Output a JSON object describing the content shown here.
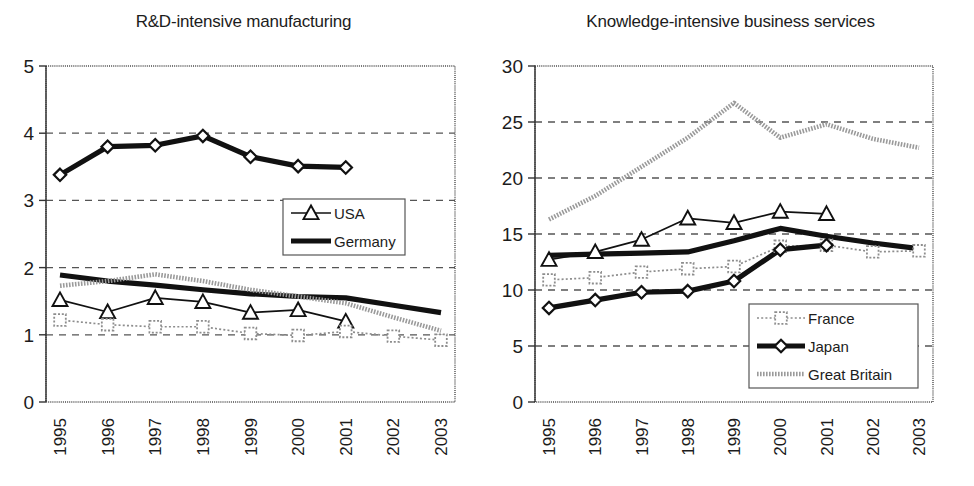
{
  "figure": {
    "width": 974,
    "height": 486,
    "background": "#ffffff"
  },
  "colors": {
    "axis": "#333333",
    "frame": "#4a4a4a",
    "grid": "#555555",
    "germany": "#111111",
    "usa": "#111111",
    "france": "#8d8d8d",
    "great_britain": "#9a9a9a",
    "japan": "#111111"
  },
  "chart_data": [
    {
      "type": "line",
      "panel": "left",
      "title": "R&D-intensive manufacturing",
      "xlabel": "",
      "ylabel": "",
      "x": [
        "1995",
        "1996",
        "1997",
        "1998",
        "1999",
        "2000",
        "2001",
        "2002",
        "2003"
      ],
      "xtick_labels": [
        "1995",
        "1996",
        "1997",
        "1998",
        "1999",
        "2000",
        "2001",
        "2002",
        "2003"
      ],
      "ytick_labels": [
        "0",
        "1",
        "2",
        "3",
        "4",
        "5"
      ],
      "yticks": [
        0,
        1,
        2,
        3,
        4,
        5
      ],
      "ylim": [
        0,
        5
      ],
      "grid": "horizontal-dashed",
      "legend_position": "center-right",
      "legend_entries": [
        "USA",
        "Germany"
      ],
      "series": [
        {
          "name": "Germany",
          "style": "thick-solid-diamond",
          "marker": "diamond",
          "x": [
            "1995",
            "1996",
            "1997",
            "1998",
            "1999",
            "2000",
            "2001"
          ],
          "values": [
            3.38,
            3.8,
            3.82,
            3.96,
            3.65,
            3.51,
            3.49
          ]
        },
        {
          "name": "Germany-low",
          "style": "thick-solid",
          "marker": "none",
          "x": [
            "1995",
            "1996",
            "1997",
            "1998",
            "1999",
            "2000",
            "2001",
            "2002",
            "2003"
          ],
          "values": [
            1.89,
            1.8,
            1.74,
            1.67,
            1.61,
            1.57,
            1.55,
            1.44,
            1.33
          ]
        },
        {
          "name": "Great Britain",
          "style": "hatched-thick",
          "marker": "none",
          "x": [
            "1995",
            "1996",
            "1997",
            "1998",
            "1999",
            "2000",
            "2001",
            "2002",
            "2003"
          ],
          "values": [
            1.73,
            1.8,
            1.9,
            1.8,
            1.67,
            1.57,
            1.47,
            1.26,
            1.06
          ]
        },
        {
          "name": "USA",
          "style": "thin-solid-triangle",
          "marker": "triangle",
          "x": [
            "1995",
            "1996",
            "1997",
            "1998",
            "1999",
            "2000",
            "2001"
          ],
          "values": [
            1.52,
            1.34,
            1.55,
            1.49,
            1.33,
            1.37,
            1.2
          ]
        },
        {
          "name": "France",
          "style": "dotted-square",
          "marker": "square",
          "x": [
            "1995",
            "1996",
            "1997",
            "1998",
            "1999",
            "2000",
            "2001",
            "2002",
            "2003"
          ],
          "values": [
            1.22,
            1.15,
            1.12,
            1.12,
            1.02,
            0.99,
            1.05,
            0.98,
            0.92
          ]
        }
      ]
    },
    {
      "type": "line",
      "panel": "right",
      "title": "Knowledge-intensive business services",
      "xlabel": "",
      "ylabel": "",
      "x": [
        "1995",
        "1996",
        "1997",
        "1998",
        "1999",
        "2000",
        "2001",
        "2002",
        "2003"
      ],
      "xtick_labels": [
        "1995",
        "1996",
        "1997",
        "1998",
        "1999",
        "2000",
        "2001",
        "2002",
        "2003"
      ],
      "ytick_labels": [
        "0",
        "5",
        "10",
        "15",
        "20",
        "25",
        "30"
      ],
      "yticks": [
        0,
        5,
        10,
        15,
        20,
        25,
        30
      ],
      "ylim": [
        0,
        30
      ],
      "grid": "horizontal-dashed",
      "legend_position": "bottom-center",
      "legend_entries": [
        "France",
        "Japan",
        "Great Britain"
      ],
      "series": [
        {
          "name": "Great Britain",
          "style": "hatched-thick",
          "marker": "none",
          "x": [
            "1995",
            "1996",
            "1997",
            "1998",
            "1999",
            "2000",
            "2001",
            "2002",
            "2003"
          ],
          "values": [
            16.3,
            18.4,
            21.0,
            23.6,
            26.7,
            23.6,
            24.8,
            23.5,
            22.7
          ]
        },
        {
          "name": "USA",
          "style": "thin-solid-triangle",
          "marker": "triangle",
          "x": [
            "1995",
            "1996",
            "1997",
            "1998",
            "1999",
            "2000",
            "2001"
          ],
          "values": [
            12.7,
            13.4,
            14.5,
            16.4,
            16.0,
            17.0,
            16.8
          ]
        },
        {
          "name": "Germany",
          "style": "thick-solid",
          "marker": "none",
          "x": [
            "1995",
            "1996",
            "1997",
            "1998",
            "1999",
            "2000",
            "2001",
            "2002",
            "2003"
          ],
          "values": [
            13.1,
            13.2,
            13.3,
            13.4,
            14.4,
            15.5,
            14.8,
            14.2,
            13.7
          ]
        },
        {
          "name": "France",
          "style": "dotted-square",
          "marker": "square",
          "x": [
            "1995",
            "1996",
            "1997",
            "1998",
            "1999",
            "2000",
            "2001",
            "2002",
            "2003"
          ],
          "values": [
            10.9,
            11.1,
            11.6,
            11.9,
            12.1,
            13.9,
            14.0,
            13.4,
            13.5
          ]
        },
        {
          "name": "Japan",
          "style": "thick-solid-diamond",
          "marker": "diamond",
          "x": [
            "1995",
            "1996",
            "1997",
            "1998",
            "1999",
            "2000",
            "2001"
          ],
          "values": [
            8.4,
            9.1,
            9.8,
            9.9,
            10.8,
            13.6,
            14.0
          ]
        }
      ]
    }
  ]
}
